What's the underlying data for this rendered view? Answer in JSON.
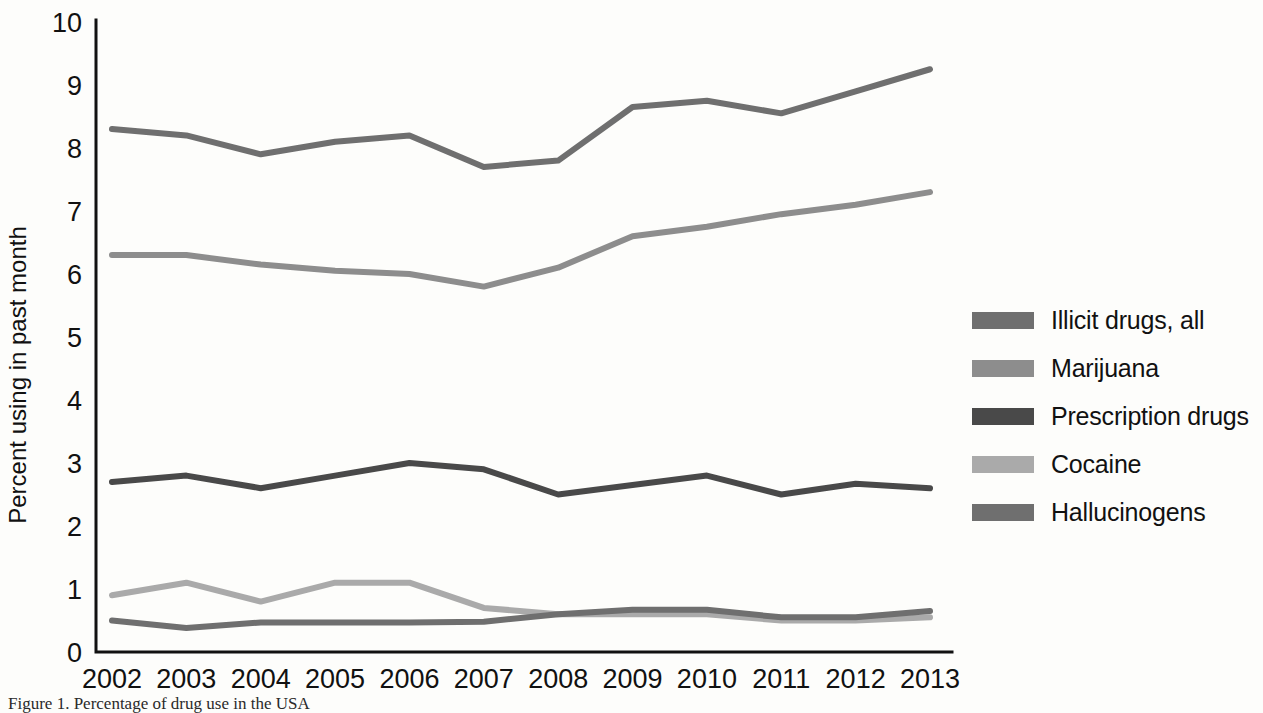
{
  "figure": {
    "caption": "Figure 1. Percentage of drug use in the USA"
  },
  "axes": {
    "y_title": "Percent using in past month",
    "y_ticks": [
      "0",
      "1",
      "2",
      "3",
      "4",
      "5",
      "6",
      "7",
      "8",
      "9",
      "10"
    ],
    "x_ticks": [
      "2002",
      "2003",
      "2004",
      "2005",
      "2006",
      "2007",
      "2008",
      "2009",
      "2010",
      "2011",
      "2012",
      "2013"
    ]
  },
  "legend": {
    "items": [
      {
        "label": "Illicit drugs, all",
        "color": "#6f6f6f"
      },
      {
        "label": "Marijuana",
        "color": "#8d8d8d"
      },
      {
        "label": "Prescription drugs",
        "color": "#494949"
      },
      {
        "label": "Cocaine",
        "color": "#aaaaaa"
      },
      {
        "label": "Hallucinogens",
        "color": "#6f6f6f"
      }
    ]
  },
  "chart_data": {
    "type": "line",
    "title": "",
    "xlabel": "",
    "ylabel": "Percent using in past month",
    "categories": [
      2002,
      2003,
      2004,
      2005,
      2006,
      2007,
      2008,
      2009,
      2010,
      2011,
      2012,
      2013
    ],
    "xlim": [
      2002,
      2013
    ],
    "ylim": [
      0,
      10
    ],
    "grid": false,
    "legend_position": "right",
    "series": [
      {
        "name": "Illicit drugs, all",
        "color": "#6f6f6f",
        "values": [
          8.3,
          8.2,
          7.9,
          8.1,
          8.2,
          7.7,
          7.8,
          8.65,
          8.75,
          8.55,
          8.9,
          9.25
        ]
      },
      {
        "name": "Marijuana",
        "color": "#8d8d8d",
        "values": [
          6.3,
          6.3,
          6.15,
          6.05,
          6.0,
          5.8,
          6.1,
          6.6,
          6.75,
          6.95,
          7.1,
          7.3
        ]
      },
      {
        "name": "Prescription drugs",
        "color": "#494949",
        "values": [
          2.7,
          2.8,
          2.6,
          2.8,
          3.0,
          2.9,
          2.5,
          2.65,
          2.8,
          2.5,
          2.67,
          2.6
        ]
      },
      {
        "name": "Cocaine",
        "color": "#aaaaaa",
        "values": [
          0.9,
          1.1,
          0.8,
          1.1,
          1.1,
          0.7,
          0.6,
          0.6,
          0.6,
          0.5,
          0.5,
          0.55
        ]
      },
      {
        "name": "Hallucinogens",
        "color": "#6f6f6f",
        "values": [
          0.5,
          0.38,
          0.47,
          0.47,
          0.47,
          0.48,
          0.6,
          0.67,
          0.67,
          0.55,
          0.55,
          0.65
        ]
      }
    ]
  }
}
